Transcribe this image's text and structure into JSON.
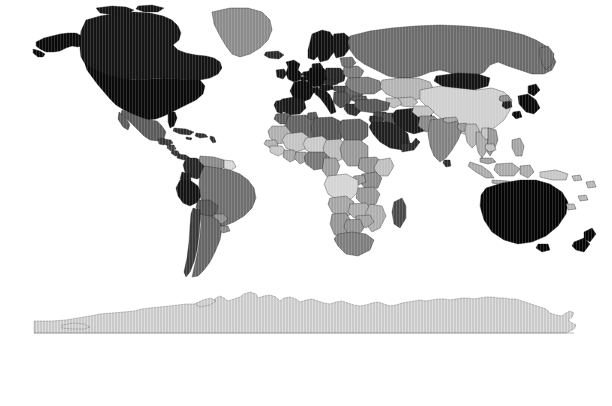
{
  "figure": {
    "panel_label": "C",
    "type": "choropleth-world-map",
    "projection": "equirectangular",
    "background_color": "#ffffff",
    "border_color": "#000000"
  },
  "chart_data": {
    "type": "heatmap",
    "title": "",
    "subtitle": "",
    "xlabel": "",
    "ylabel": "",
    "colorbar": {
      "orientation": "horizontal",
      "ticks": [
        500,
        1000,
        1500,
        2000,
        2500,
        3000
      ],
      "tick_labels": [
        "500",
        "1k",
        "1.5k",
        "2k",
        "2.5k",
        "3k"
      ],
      "range": [
        30,
        3260
      ],
      "colormap": "grayscale-cyclic-black-white-black",
      "endpoint_colors": [
        "#000000",
        "#ffffff",
        "#000000"
      ],
      "midpoint_value": 2180,
      "grid": false,
      "legend_position": "bottom"
    },
    "value_marks": [
      40,
      55,
      70,
      90,
      110,
      125,
      140,
      160,
      175,
      190,
      205,
      215,
      230,
      245,
      255,
      270,
      285,
      300,
      315,
      330,
      345,
      360,
      375,
      390,
      405,
      420,
      455,
      470,
      485,
      500,
      515,
      530,
      545,
      560,
      575,
      590,
      620,
      640,
      660,
      680,
      700,
      715,
      730,
      745,
      760,
      775,
      790,
      830,
      850,
      870,
      895,
      940,
      960,
      980,
      1000,
      1020,
      1040,
      1060,
      1080,
      1100,
      1120,
      1140,
      1160,
      1185,
      1205,
      1225,
      1250,
      1305,
      1345,
      1430,
      1480,
      1545,
      1600,
      1630,
      1680,
      1720,
      1760,
      1830,
      1870,
      1930,
      1990,
      2040,
      2090,
      2150,
      2210,
      2260,
      2300,
      2340,
      2420,
      2560,
      2680,
      2740,
      2810,
      2870,
      2960,
      3080,
      3230
    ],
    "regions": [
      {
        "name": "United States of America",
        "value": 3150,
        "shade": "#0a0a0a"
      },
      {
        "name": "Canada",
        "value": 3040,
        "shade": "#141414"
      },
      {
        "name": "Greenland",
        "value": 1200,
        "shade": "#8c8c8c"
      },
      {
        "name": "Mexico",
        "value": 1650,
        "shade": "#5a5a5a"
      },
      {
        "name": "Guatemala",
        "value": 780,
        "shade": "#3a3a3a"
      },
      {
        "name": "Honduras",
        "value": 760,
        "shade": "#3c3c3c"
      },
      {
        "name": "Nicaragua",
        "value": 700,
        "shade": "#434343"
      },
      {
        "name": "Costa Rica",
        "value": 820,
        "shade": "#363636"
      },
      {
        "name": "Panama",
        "value": 870,
        "shade": "#303030"
      },
      {
        "name": "Cuba",
        "value": 900,
        "shade": "#2e2e2e"
      },
      {
        "name": "Colombia",
        "value": 2700,
        "shade": "#262626"
      },
      {
        "name": "Venezuela",
        "value": 1180,
        "shade": "#8a8a8a"
      },
      {
        "name": "Ecuador",
        "value": 2820,
        "shade": "#1c1c1c"
      },
      {
        "name": "Peru",
        "value": 2880,
        "shade": "#141414"
      },
      {
        "name": "Bolivia",
        "value": 1700,
        "shade": "#555555"
      },
      {
        "name": "Brazil",
        "value": 1900,
        "shade": "#6e6e6e"
      },
      {
        "name": "Chile",
        "value": 2300,
        "shade": "#3c3c3c"
      },
      {
        "name": "Argentina",
        "value": 1880,
        "shade": "#666666"
      },
      {
        "name": "Paraguay",
        "value": 1350,
        "shade": "#8f8f8f"
      },
      {
        "name": "Uruguay",
        "value": 1320,
        "shade": "#8a8a8a"
      },
      {
        "name": "Guyana",
        "value": 1000,
        "shade": "#d8d8d8"
      },
      {
        "name": "United Kingdom",
        "value": 3060,
        "shade": "#0c0c0c"
      },
      {
        "name": "Ireland",
        "value": 2900,
        "shade": "#1a1a1a"
      },
      {
        "name": "Norway",
        "value": 3010,
        "shade": "#101010"
      },
      {
        "name": "Sweden",
        "value": 3020,
        "shade": "#101010"
      },
      {
        "name": "Finland",
        "value": 2980,
        "shade": "#141414"
      },
      {
        "name": "Denmark",
        "value": 2990,
        "shade": "#121212"
      },
      {
        "name": "Germany",
        "value": 3120,
        "shade": "#0a0a0a"
      },
      {
        "name": "France",
        "value": 3080,
        "shade": "#0c0c0c"
      },
      {
        "name": "Spain",
        "value": 2930,
        "shade": "#181818"
      },
      {
        "name": "Portugal",
        "value": 2880,
        "shade": "#1d1d1d"
      },
      {
        "name": "Italy",
        "value": 3000,
        "shade": "#121212"
      },
      {
        "name": "Poland",
        "value": 2820,
        "shade": "#242424"
      },
      {
        "name": "Netherlands",
        "value": 3100,
        "shade": "#0b0b0b"
      },
      {
        "name": "Belgium",
        "value": 3090,
        "shade": "#0b0b0b"
      },
      {
        "name": "Switzerland",
        "value": 3050,
        "shade": "#0e0e0e"
      },
      {
        "name": "Austria",
        "value": 3000,
        "shade": "#131313"
      },
      {
        "name": "Czech Republic",
        "value": 2800,
        "shade": "#262626"
      },
      {
        "name": "Hungary",
        "value": 2560,
        "shade": "#454545"
      },
      {
        "name": "Romania",
        "value": 2400,
        "shade": "#5e5e5e"
      },
      {
        "name": "Bulgaria",
        "value": 2460,
        "shade": "#585858"
      },
      {
        "name": "Greece",
        "value": 2700,
        "shade": "#2f2f2f"
      },
      {
        "name": "Ukraine",
        "value": 2180,
        "shade": "#7a7a7a"
      },
      {
        "name": "Belarus",
        "value": 2150,
        "shade": "#7d7d7d"
      },
      {
        "name": "Russia",
        "value": 2000,
        "shade": "#6b6b6b"
      },
      {
        "name": "Turkey",
        "value": 2480,
        "shade": "#565656"
      },
      {
        "name": "Iran",
        "value": 2900,
        "shade": "#1a1a1a"
      },
      {
        "name": "Iraq",
        "value": 2560,
        "shade": "#4a4a4a"
      },
      {
        "name": "Saudi Arabia",
        "value": 2850,
        "shade": "#202020"
      },
      {
        "name": "Israel",
        "value": 2780,
        "shade": "#2a2a2a"
      },
      {
        "name": "Jordan",
        "value": 2700,
        "shade": "#333333"
      },
      {
        "name": "Syria",
        "value": 2600,
        "shade": "#424242"
      },
      {
        "name": "Egypt",
        "value": 2380,
        "shade": "#606060"
      },
      {
        "name": "Libya",
        "value": 1560,
        "shade": "#565656"
      },
      {
        "name": "Algeria",
        "value": 1520,
        "shade": "#626262"
      },
      {
        "name": "Morocco",
        "value": 1620,
        "shade": "#5e5e5e"
      },
      {
        "name": "Tunisia",
        "value": 1700,
        "shade": "#565656"
      },
      {
        "name": "Mauritania",
        "value": 1050,
        "shade": "#b0b0b0"
      },
      {
        "name": "Mali",
        "value": 980,
        "shade": "#c4c4c4"
      },
      {
        "name": "Niger",
        "value": 920,
        "shade": "#cacaca"
      },
      {
        "name": "Chad",
        "value": 1010,
        "shade": "#bdbdbd"
      },
      {
        "name": "Sudan",
        "value": 1250,
        "shade": "#9a9a9a"
      },
      {
        "name": "Nigeria",
        "value": 1400,
        "shade": "#777777"
      },
      {
        "name": "Ghana",
        "value": 1150,
        "shade": "#a2a2a2"
      },
      {
        "name": "Ivory Coast",
        "value": 1120,
        "shade": "#a8a8a8"
      },
      {
        "name": "Senegal",
        "value": 1050,
        "shade": "#b2b2b2"
      },
      {
        "name": "Guinea",
        "value": 900,
        "shade": "#c8c8c8"
      },
      {
        "name": "Cameroon",
        "value": 1180,
        "shade": "#9e9e9e"
      },
      {
        "name": "Ethiopia",
        "value": 1260,
        "shade": "#959595"
      },
      {
        "name": "Somalia",
        "value": 980,
        "shade": "#c0c0c0"
      },
      {
        "name": "Kenya",
        "value": 1320,
        "shade": "#8b8b8b"
      },
      {
        "name": "Uganda",
        "value": 1200,
        "shade": "#9c9c9c"
      },
      {
        "name": "Tanzania",
        "value": 1230,
        "shade": "#989898"
      },
      {
        "name": "DR Congo",
        "value": 900,
        "shade": "#d4d4d4"
      },
      {
        "name": "Angola",
        "value": 1160,
        "shade": "#a6a6a6"
      },
      {
        "name": "Zambia",
        "value": 1100,
        "shade": "#adadad"
      },
      {
        "name": "Zimbabwe",
        "value": 1150,
        "shade": "#a4a4a4"
      },
      {
        "name": "Mozambique",
        "value": 1080,
        "shade": "#b0b0b0"
      },
      {
        "name": "Madagascar",
        "value": 1450,
        "shade": "#4a4a4a"
      },
      {
        "name": "South Africa",
        "value": 1640,
        "shade": "#7e7e7e"
      },
      {
        "name": "Namibia",
        "value": 1240,
        "shade": "#969696"
      },
      {
        "name": "Botswana",
        "value": 1280,
        "shade": "#929292"
      },
      {
        "name": "Kazakhstan",
        "value": 1480,
        "shade": "#b4b4b4"
      },
      {
        "name": "Uzbekistan",
        "value": 1420,
        "shade": "#bcbcbc"
      },
      {
        "name": "Turkmenistan",
        "value": 1400,
        "shade": "#bebebe"
      },
      {
        "name": "Afghanistan",
        "value": 1340,
        "shade": "#c2c2c2"
      },
      {
        "name": "Pakistan",
        "value": 1620,
        "shade": "#888888"
      },
      {
        "name": "India",
        "value": 1680,
        "shade": "#828282"
      },
      {
        "name": "Nepal",
        "value": 1500,
        "shade": "#a6a6a6"
      },
      {
        "name": "Bangladesh",
        "value": 1550,
        "shade": "#9c9c9c"
      },
      {
        "name": "Sri Lanka",
        "value": 2700,
        "shade": "#2d2d2d"
      },
      {
        "name": "China",
        "value": 1900,
        "shade": "#d0d0d0"
      },
      {
        "name": "Mongolia",
        "value": 2980,
        "shade": "#141414"
      },
      {
        "name": "Japan",
        "value": 3110,
        "shade": "#090909"
      },
      {
        "name": "South Korea",
        "value": 2880,
        "shade": "#1e1e1e"
      },
      {
        "name": "North Korea",
        "value": 1600,
        "shade": "#8e8e8e"
      },
      {
        "name": "Myanmar",
        "value": 1420,
        "shade": "#b8b8b8"
      },
      {
        "name": "Thailand",
        "value": 1480,
        "shade": "#ababab"
      },
      {
        "name": "Vietnam",
        "value": 1560,
        "shade": "#9a9a9a"
      },
      {
        "name": "Laos",
        "value": 1340,
        "shade": "#c4c4c4"
      },
      {
        "name": "Cambodia",
        "value": 1380,
        "shade": "#bfbfbf"
      },
      {
        "name": "Malaysia",
        "value": 1520,
        "shade": "#a0a0a0"
      },
      {
        "name": "Indonesia",
        "value": 1460,
        "shade": "#acacac"
      },
      {
        "name": "Philippines",
        "value": 1500,
        "shade": "#a5a5a5"
      },
      {
        "name": "Papua New Guinea",
        "value": 1300,
        "shade": "#c8c8c8"
      },
      {
        "name": "Australia",
        "value": 3180,
        "shade": "#060606"
      },
      {
        "name": "New Zealand",
        "value": 3200,
        "shade": "#050505"
      },
      {
        "name": "Antarctica",
        "value": 1900,
        "shade": "#cacaca"
      }
    ]
  }
}
